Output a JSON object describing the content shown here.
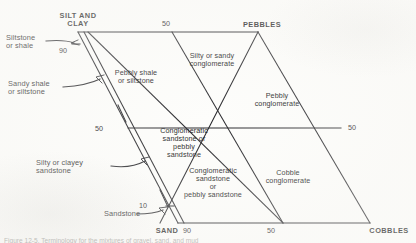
{
  "figure": {
    "type": "classification-diagram",
    "shape": "parallelogram",
    "caption_partial": "Figure 12-5.   Terminology for the mixtures of gravel, sand, and mud"
  },
  "vertices": [
    {
      "name": "silt-and-clay",
      "label": "SILT AND\nCLAY"
    },
    {
      "name": "pebbles",
      "label": "PEBBLES"
    },
    {
      "name": "sand",
      "label": "SAND"
    },
    {
      "name": "cobbles",
      "label": "COBBLES"
    }
  ],
  "ticks": [
    {
      "name": "tick-top-50",
      "label": "50"
    },
    {
      "name": "tick-left-90",
      "label": "90"
    },
    {
      "name": "tick-left-50",
      "label": "50"
    },
    {
      "name": "tick-left-10",
      "label": "10"
    },
    {
      "name": "tick-right-50",
      "label": "50"
    },
    {
      "name": "tick-bottom-90",
      "label": "90"
    },
    {
      "name": "tick-bottom-50",
      "label": "50"
    }
  ],
  "fields": [
    {
      "name": "field-pebbly-shale",
      "label": "Pebbly shale\nor siltstone"
    },
    {
      "name": "field-silty-sandy-conglomerate",
      "label": "Silty or sandy\nconglomerate"
    },
    {
      "name": "field-pebbly-conglomerate",
      "label": "Pebbly\nconglomerate"
    },
    {
      "name": "field-conglomeratic-sandstone-upper",
      "label": "Conglomeratic\nsandstone or\npebbly\nsandstone"
    },
    {
      "name": "field-conglomeratic-sandstone-lower",
      "label": "Conglomeratic\nsandstone\nor\npebbly sandstone"
    },
    {
      "name": "field-cobble-conglomerate",
      "label": "Cobble\nconglomerate"
    }
  ],
  "callouts": [
    {
      "name": "callout-siltstone-or-shale",
      "label": "Siltstone\nor shale"
    },
    {
      "name": "callout-sandy-shale",
      "label": "Sandy shale\nor siltstone"
    },
    {
      "name": "callout-silty-clayey-sandstone",
      "label": "Silty or clayey\nsandstone"
    },
    {
      "name": "callout-sandstone",
      "label": "Sandstone"
    }
  ],
  "colors": {
    "line": "#26262a",
    "text": "#1c1c1c",
    "background": "#fdfdfb"
  }
}
